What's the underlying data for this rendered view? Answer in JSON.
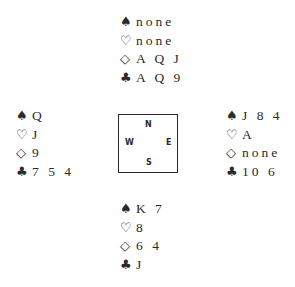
{
  "suit_symbols": {
    "spades": "♠",
    "hearts": "♡",
    "diamonds": "◇",
    "clubs": "♣"
  },
  "hands": {
    "north": {
      "spades": "none",
      "hearts": "none",
      "diamonds": "A Q J",
      "clubs": "A Q 9"
    },
    "west": {
      "spades": "Q",
      "hearts": "J",
      "diamonds": "9",
      "clubs": "7 5 4"
    },
    "east": {
      "spades": "J 8 4",
      "hearts": "A",
      "diamonds": "none",
      "clubs": "10 6"
    },
    "south": {
      "spades": "K 7",
      "hearts": "8",
      "diamonds": "6 4",
      "clubs": "J"
    }
  },
  "compass": {
    "north": "N",
    "south": "S",
    "west": "W",
    "east": "E"
  }
}
